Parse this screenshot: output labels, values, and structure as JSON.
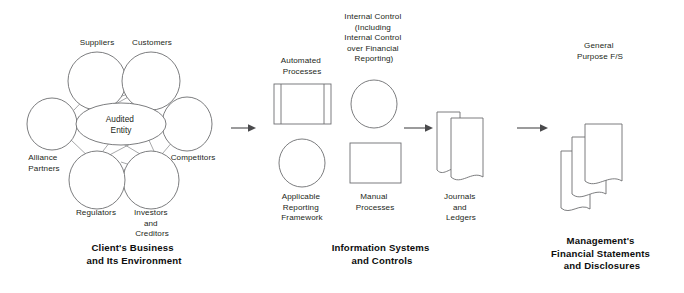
{
  "diagram": {
    "colors": {
      "shape_stroke": "#6d6e71",
      "connector_stroke": "#8a8b8e",
      "arrow": "#4a4a4c",
      "text": "#231f20",
      "caption_text": "#0d0d0d",
      "background": "#ffffff"
    },
    "sections": [
      {
        "id": "client-business",
        "caption_lines": [
          "Client's Business",
          "and Its Environment"
        ]
      },
      {
        "id": "information-systems",
        "caption_lines": [
          "Information Systems",
          "and Controls"
        ]
      },
      {
        "id": "management-statements",
        "caption_lines": [
          "Management's",
          "Financial Statements",
          "and Disclosures"
        ]
      }
    ],
    "network": {
      "center": {
        "id": "audited-entity",
        "label_lines": [
          "Audited",
          "Entity"
        ],
        "shape": "ellipse"
      },
      "nodes": [
        {
          "id": "suppliers",
          "label_lines": [
            "Suppliers"
          ],
          "shape": "circle"
        },
        {
          "id": "customers",
          "label_lines": [
            "Customers"
          ],
          "shape": "circle"
        },
        {
          "id": "competitors",
          "label_lines": [
            "Competitors"
          ],
          "shape": "circle"
        },
        {
          "id": "investors-creditors",
          "label_lines": [
            "Investors",
            "and",
            "Creditors"
          ],
          "shape": "circle"
        },
        {
          "id": "regulators",
          "label_lines": [
            "Regulators"
          ],
          "shape": "circle"
        },
        {
          "id": "alliance-partners",
          "label_lines": [
            "Alliance",
            "Partners"
          ],
          "shape": "circle"
        }
      ]
    },
    "systems": {
      "nodes": [
        {
          "id": "automated-processes",
          "label_lines": [
            "Automated",
            "Processes"
          ],
          "shape": "predefined-process",
          "label_position": "above"
        },
        {
          "id": "internal-control",
          "label_lines": [
            "Internal Control",
            "(Including",
            "Internal Control",
            "over Financial",
            "Reporting)"
          ],
          "shape": "circle",
          "label_position": "above"
        },
        {
          "id": "applicable-reporting-framework",
          "label_lines": [
            "Applicable",
            "Reporting",
            "Framework"
          ],
          "shape": "circle",
          "label_position": "below"
        },
        {
          "id": "manual-processes",
          "label_lines": [
            "Manual",
            "Processes"
          ],
          "shape": "rectangle",
          "label_position": "below"
        },
        {
          "id": "journals-and-ledgers",
          "label_lines": [
            "Journals",
            "and",
            "Ledgers"
          ],
          "shape": "document-stack-2",
          "label_position": "below"
        }
      ]
    },
    "output": {
      "nodes": [
        {
          "id": "general-purpose-fs",
          "label_lines": [
            "General",
            "Purpose F/S"
          ],
          "shape": "document-stack-3",
          "label_position": "above"
        }
      ]
    },
    "arrows": [
      {
        "id": "arrow-business-to-systems",
        "from": "client-business",
        "to": "information-systems"
      },
      {
        "id": "arrow-processes-to-journals",
        "from": "processes",
        "to": "journals-and-ledgers"
      },
      {
        "id": "arrow-systems-to-statements",
        "from": "information-systems",
        "to": "management-statements"
      }
    ]
  }
}
